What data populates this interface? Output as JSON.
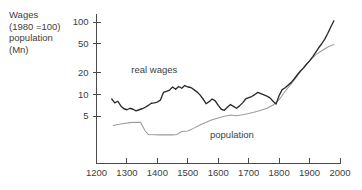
{
  "header": {
    "lines": [
      "Wages",
      "(1980 =100)",
      "population",
      "(Mn)"
    ],
    "text": "Wages\n(1980 =100)\npopulation\n(Mn)"
  },
  "chart_data": {
    "type": "line",
    "title": "Wages (1980 =100) population (Mn)",
    "xlabel": "",
    "ylabel": "",
    "yscale": "log",
    "ylim": [
      2,
      130
    ],
    "xlim": [
      1200,
      2000
    ],
    "grid": false,
    "legend_position": "inline-annotation",
    "y_ticks": [
      100,
      50,
      20,
      10,
      5
    ],
    "y_tick_labels": [
      "100",
      "50",
      "20",
      "10",
      "5"
    ],
    "x_ticks": [
      1200,
      1300,
      1400,
      1500,
      1600,
      1700,
      1800,
      1900,
      2000
    ],
    "x_tick_labels": [
      "1200",
      "1300",
      "1400",
      "1500",
      "1600",
      "1700",
      "1800",
      "1900",
      "2000"
    ],
    "annotations": [
      {
        "text": "real wages",
        "x": 1390,
        "y": 20
      },
      {
        "text": "population",
        "x": 1645,
        "y": 2.45
      }
    ],
    "series": [
      {
        "name": "real wages",
        "color": "#2b2b2b",
        "x": [
          1250,
          1260,
          1270,
          1280,
          1290,
          1300,
          1310,
          1320,
          1330,
          1340,
          1350,
          1360,
          1370,
          1380,
          1390,
          1400,
          1410,
          1420,
          1430,
          1440,
          1450,
          1460,
          1470,
          1480,
          1490,
          1500,
          1510,
          1520,
          1530,
          1540,
          1550,
          1560,
          1570,
          1580,
          1590,
          1600,
          1610,
          1620,
          1630,
          1640,
          1650,
          1660,
          1670,
          1680,
          1690,
          1700,
          1710,
          1720,
          1730,
          1740,
          1750,
          1760,
          1770,
          1780,
          1790,
          1800,
          1810,
          1820,
          1830,
          1840,
          1850,
          1860,
          1870,
          1880,
          1890,
          1900,
          1910,
          1920,
          1930,
          1940,
          1950,
          1960,
          1970,
          1980
        ],
        "values": [
          8.6,
          7.6,
          8.0,
          6.9,
          6.3,
          6.1,
          6.4,
          6.2,
          5.9,
          6.1,
          6.3,
          6.6,
          7.0,
          7.5,
          7.6,
          7.8,
          8.3,
          10.6,
          11.0,
          11.4,
          12.6,
          11.7,
          12.8,
          12.1,
          13.2,
          12.6,
          12.4,
          11.6,
          10.8,
          9.8,
          8.6,
          7.4,
          7.9,
          8.6,
          8.1,
          7.0,
          6.2,
          6.0,
          6.6,
          7.2,
          6.8,
          6.4,
          6.9,
          7.6,
          8.6,
          9.0,
          9.3,
          9.9,
          10.6,
          10.2,
          9.8,
          9.4,
          8.9,
          8.0,
          7.3,
          9.6,
          11.6,
          12.3,
          13.4,
          14.6,
          16.4,
          18.6,
          21.0,
          23.0,
          26.0,
          29.0,
          33.0,
          38.0,
          44.0,
          50.0,
          58.0,
          70.0,
          86.0,
          104.0
        ]
      },
      {
        "name": "population",
        "color": "#9b9b9b",
        "x": [
          1255,
          1270,
          1290,
          1310,
          1330,
          1345,
          1360,
          1370,
          1390,
          1410,
          1430,
          1450,
          1465,
          1480,
          1500,
          1520,
          1540,
          1560,
          1580,
          1600,
          1620,
          1640,
          1660,
          1680,
          1700,
          1720,
          1740,
          1760,
          1780,
          1800,
          1820,
          1840,
          1860,
          1880,
          1900,
          1920,
          1940,
          1960,
          1980
        ],
        "values": [
          3.7,
          3.82,
          3.95,
          4.05,
          4.1,
          4.08,
          3.1,
          2.78,
          2.75,
          2.74,
          2.74,
          2.74,
          2.78,
          3.05,
          3.1,
          3.4,
          3.75,
          4.1,
          4.45,
          4.7,
          4.95,
          5.15,
          5.05,
          5.2,
          5.4,
          5.7,
          6.0,
          6.4,
          7.1,
          8.4,
          11.0,
          14.0,
          18.0,
          23.5,
          29.0,
          35.0,
          40.0,
          45.0,
          49.0
        ]
      }
    ]
  }
}
